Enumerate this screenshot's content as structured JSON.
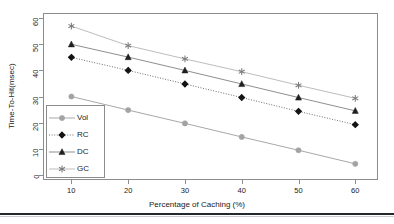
{
  "chart_data": {
    "type": "line",
    "title": "",
    "xlabel": "Percentage of Caching (%)",
    "ylabel": "Time-To-Hit(msec)",
    "x": [
      10,
      20,
      30,
      40,
      50,
      60
    ],
    "xticks": [
      "10",
      "20",
      "30",
      "40",
      "50",
      "60"
    ],
    "yticks": [
      "0",
      "10",
      "20",
      "30",
      "40",
      "50",
      "60"
    ],
    "xlim": [
      5,
      64
    ],
    "ylim": [
      -2,
      62
    ],
    "grid": false,
    "legend_position": "bottom-left-inside",
    "series": [
      {
        "name": "Vol",
        "values": [
          30.0,
          24.8,
          19.7,
          14.5,
          9.4,
          4.2
        ],
        "marker": "circle",
        "line_style": "solid",
        "color": "#a8a8a8",
        "marker_color": "#a3a3a3"
      },
      {
        "name": "RC",
        "values": [
          45.0,
          40.0,
          34.8,
          29.6,
          24.3,
          19.2
        ],
        "marker": "diamond",
        "line_style": "dotted",
        "color": "#6e6e6e",
        "marker_color": "#141414"
      },
      {
        "name": "DC",
        "values": [
          50.0,
          45.1,
          40.0,
          34.8,
          29.6,
          24.5
        ],
        "marker": "triangle",
        "line_style": "solid",
        "color": "#8f8f8f",
        "marker_color": "#1f1f1f"
      },
      {
        "name": "GC",
        "values": [
          57.0,
          49.5,
          44.4,
          39.5,
          34.3,
          29.3
        ],
        "marker": "asterisk",
        "line_style": "solid",
        "color": "#bdbdbd",
        "marker_color": "#7a7a7a"
      }
    ]
  },
  "legend": {
    "items": [
      {
        "label": "Vol"
      },
      {
        "label": "RC"
      },
      {
        "label": "DC"
      },
      {
        "label": "GC"
      }
    ]
  },
  "colors": {
    "axis": "#8c8c8c",
    "text": "#1a1a1a",
    "rule": "#23282d",
    "background": "#ffffff"
  }
}
